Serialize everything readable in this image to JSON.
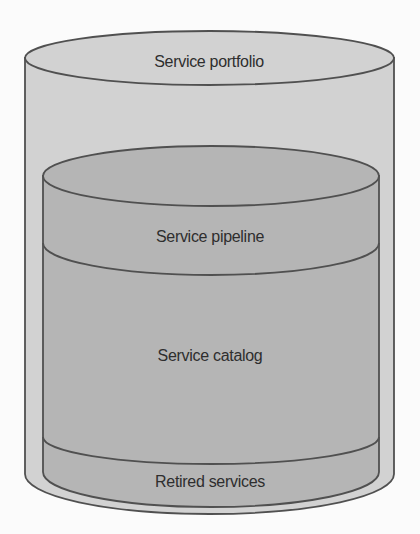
{
  "diagram": {
    "type": "nested-cylinders",
    "colors": {
      "background": "#fbfbfb",
      "outer_fill": "#d2d2d2",
      "inner_fill": "#b5b5b5",
      "stroke": "#505050",
      "text": "#2e2e2e"
    },
    "outer_cylinder": {
      "label": "Service portfolio"
    },
    "inner_cylinder": {
      "sections": [
        {
          "label": "Service pipeline"
        },
        {
          "label": "Service catalog"
        },
        {
          "label": "Retired services"
        }
      ]
    }
  }
}
